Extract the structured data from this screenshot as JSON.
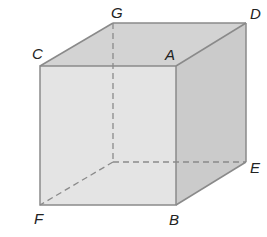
{
  "diagram": {
    "type": "cube",
    "colors": {
      "front_face": "#e3e3e3",
      "top_face": "#d2d2d2",
      "side_face": "#cacaca",
      "edge": "#8a8a8a",
      "hidden_edge": "#8a8a8a",
      "label": "#222222"
    },
    "vertices": {
      "G": {
        "label": "G"
      },
      "D": {
        "label": "D"
      },
      "C": {
        "label": "C"
      },
      "A": {
        "label": "A"
      },
      "E": {
        "label": "E"
      },
      "F": {
        "label": "F"
      },
      "B": {
        "label": "B"
      }
    }
  }
}
